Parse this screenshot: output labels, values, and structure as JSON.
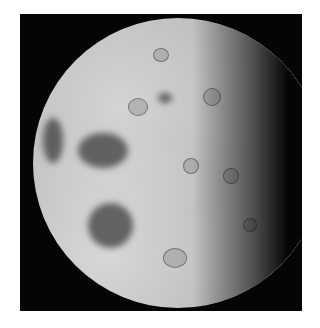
{
  "image": {
    "subject": "Moon",
    "description": "Gibbous Moon photograph showing heavily cratered surface with dark maria patches on the left side, terminator shadow on the right",
    "background_color": "#050505",
    "border_color": "#ffffff",
    "surface_color": "#bdbdbd"
  }
}
